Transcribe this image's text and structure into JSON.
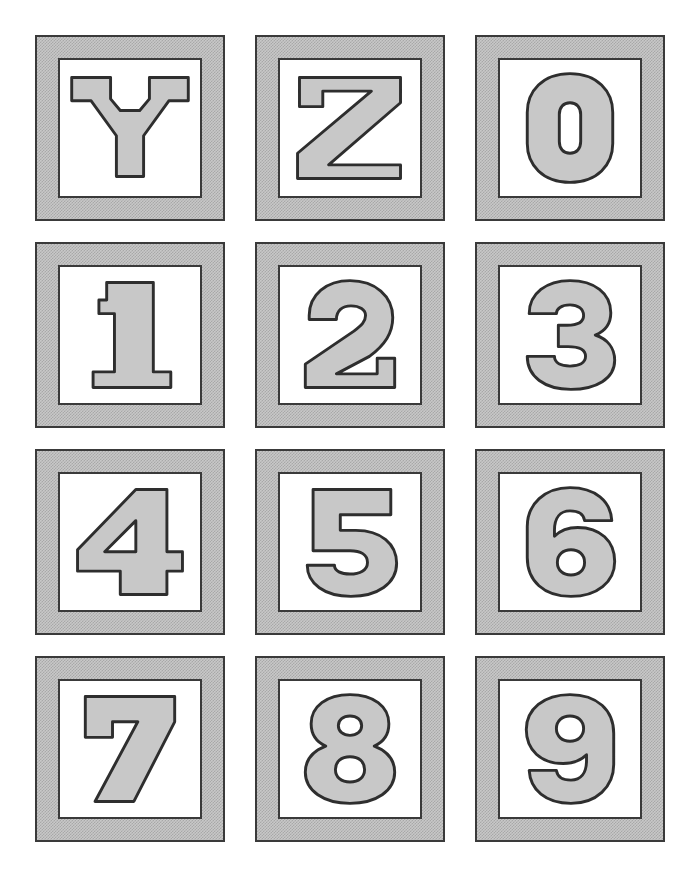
{
  "page": {
    "background_color": "#ffffff",
    "width": 698,
    "height": 869
  },
  "style": {
    "block_fill_color": "#c8c8c8",
    "block_dither_color": "#a8a8a8",
    "block_border_color": "#3a3a3a",
    "inner_panel_color": "#ffffff",
    "glyph_outline_color": "#2e2e2e",
    "glyph_fill_color": "#c8c8c8"
  },
  "grid": {
    "columns": 3,
    "rows": 4,
    "block_count": 12
  },
  "blocks": [
    {
      "index": 0,
      "character": "Y",
      "kind": "letter",
      "row": 1,
      "column": 1,
      "label": "block-letter-Y"
    },
    {
      "index": 1,
      "character": "Z",
      "kind": "letter",
      "row": 1,
      "column": 2,
      "label": "block-letter-Z"
    },
    {
      "index": 2,
      "character": "0",
      "kind": "digit",
      "row": 1,
      "column": 3,
      "label": "block-digit-0"
    },
    {
      "index": 3,
      "character": "1",
      "kind": "digit",
      "row": 2,
      "column": 1,
      "label": "block-digit-1"
    },
    {
      "index": 4,
      "character": "2",
      "kind": "digit",
      "row": 2,
      "column": 2,
      "label": "block-digit-2"
    },
    {
      "index": 5,
      "character": "3",
      "kind": "digit",
      "row": 2,
      "column": 3,
      "label": "block-digit-3"
    },
    {
      "index": 6,
      "character": "4",
      "kind": "digit",
      "row": 3,
      "column": 1,
      "label": "block-digit-4"
    },
    {
      "index": 7,
      "character": "5",
      "kind": "digit",
      "row": 3,
      "column": 2,
      "label": "block-digit-5"
    },
    {
      "index": 8,
      "character": "6",
      "kind": "digit",
      "row": 3,
      "column": 3,
      "label": "block-digit-6"
    },
    {
      "index": 9,
      "character": "7",
      "kind": "digit",
      "row": 4,
      "column": 1,
      "label": "block-digit-7"
    },
    {
      "index": 10,
      "character": "8",
      "kind": "digit",
      "row": 4,
      "column": 2,
      "label": "block-digit-8"
    },
    {
      "index": 11,
      "character": "9",
      "kind": "digit",
      "row": 4,
      "column": 3,
      "label": "block-digit-9"
    }
  ]
}
